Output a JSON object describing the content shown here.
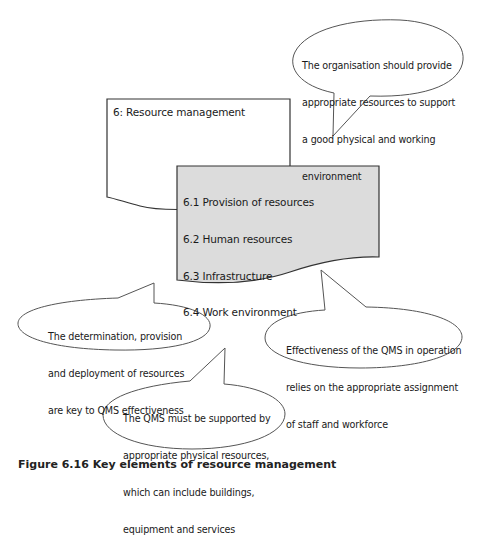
{
  "colors": {
    "outline": "#333333",
    "callout_outline": "#555555",
    "back_page_fill": "#ffffff",
    "front_page_fill": "#dcdcdc",
    "text": "#1a1a1a"
  },
  "diagram": {
    "main_document": {
      "title": "6: Resource management"
    },
    "sub_document": {
      "items": [
        "6.1 Provision of resources",
        "6.2 Human resources",
        "6.3 Infrastructure",
        "6.4 Work environment"
      ]
    },
    "callouts": [
      {
        "id": "top-right",
        "lines": [
          "The organisation should provide",
          "appropriate resources to support",
          "a good physical and working",
          "environment"
        ]
      },
      {
        "id": "left",
        "lines": [
          "The determination, provision",
          "and deployment of resources",
          "are key to QMS effectiveness"
        ]
      },
      {
        "id": "right",
        "lines": [
          "Effectiveness of the QMS in operation",
          "relies on the appropriate assignment",
          "of staff and workforce"
        ]
      },
      {
        "id": "bottom",
        "lines": [
          "The QMS must be supported by",
          "appropriate physical resources,",
          "which can include buildings,",
          "equipment and services"
        ]
      }
    ]
  },
  "caption": "Figure 6.16 Key elements of resource management"
}
